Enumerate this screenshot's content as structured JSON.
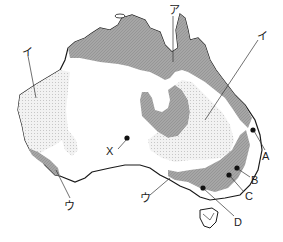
{
  "map": {
    "title": "Australia climate regions",
    "colors": {
      "outline": "#1a1a1a",
      "zone_a": "#a9a9a9",
      "zone_i_dots": "#e6e6e6",
      "background": "#ffffff"
    },
    "labels": {
      "a_region": "ア",
      "i_region_west": "イ",
      "i_region_east": "イ",
      "u_region_west": "ウ",
      "u_region_south": "ウ",
      "x_point": "X",
      "point_a": "A",
      "point_b": "B",
      "point_c": "C",
      "point_d": "D"
    }
  }
}
